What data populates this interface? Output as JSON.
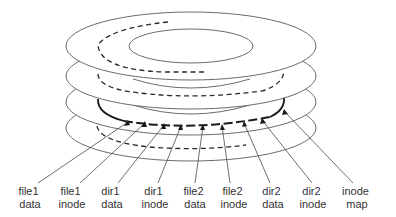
{
  "diagram": {
    "type": "log-structured disk layout",
    "platter_count": 4,
    "labels": [
      {
        "line1": "file1",
        "line2": "data",
        "label_x": 30,
        "tip_x": 128,
        "tip_y": 121
      },
      {
        "line1": "file1",
        "line2": "inode",
        "label_x": 72,
        "tip_x": 145,
        "tip_y": 122
      },
      {
        "line1": "dir1",
        "line2": "data",
        "label_x": 112,
        "tip_x": 164,
        "tip_y": 124
      },
      {
        "line1": "dir1",
        "line2": "inode",
        "label_x": 155,
        "tip_x": 181,
        "tip_y": 125
      },
      {
        "line1": "file2",
        "line2": "data",
        "label_x": 195,
        "tip_x": 203,
        "tip_y": 125
      },
      {
        "line1": "file2",
        "line2": "inode",
        "label_x": 234,
        "tip_x": 222,
        "tip_y": 125
      },
      {
        "line1": "dir2",
        "line2": "data",
        "label_x": 273,
        "tip_x": 244,
        "tip_y": 122
      },
      {
        "line1": "dir2",
        "line2": "inode",
        "label_x": 313,
        "tip_x": 262,
        "tip_y": 119
      },
      {
        "line1": "inode",
        "line2": "map",
        "label_x": 357,
        "tip_x": 284,
        "tip_y": 110
      }
    ],
    "colors": {
      "outline": "#5a5a5a",
      "track": "#1a1a1a",
      "text": "#333333",
      "background": "#ffffff"
    }
  }
}
